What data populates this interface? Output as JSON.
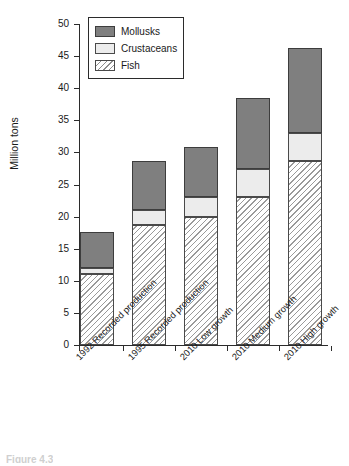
{
  "chart_data": {
    "type": "bar",
    "subtype": "stacked-bar",
    "title": "",
    "xlabel": "",
    "ylabel": "Million tons",
    "ylim": [
      0,
      50
    ],
    "yticks": [
      0,
      5,
      10,
      15,
      20,
      25,
      30,
      35,
      40,
      45,
      50
    ],
    "ytick_labels": [
      "0",
      "5",
      "10",
      "15",
      "20",
      "25",
      "30",
      "35",
      "40",
      "45",
      "50"
    ],
    "grid": false,
    "legend_position": "top-left-inside",
    "categories": [
      "1992 Recorded production",
      "1995 Recorded production",
      "2010 Low growth",
      "2010 Medium growth",
      "2010 High growth"
    ],
    "series": [
      {
        "name": "Fish",
        "values": [
          11.0,
          18.7,
          19.9,
          23.0,
          28.6
        ]
      },
      {
        "name": "Crustaceans",
        "values": [
          1.0,
          2.3,
          3.2,
          4.4,
          4.4
        ]
      },
      {
        "name": "Mollusks",
        "values": [
          5.6,
          7.7,
          7.7,
          11.1,
          13.2
        ]
      }
    ],
    "totals": [
      17.6,
      28.7,
      30.8,
      38.5,
      46.2
    ],
    "colors": {
      "mollusks": "#7f7f7f",
      "crustaceans": "#ececec",
      "fish": "#ffffff",
      "fish_hatch": "#9a9a9a",
      "axis": "#2b2b2b",
      "text": "#1a1a1a"
    }
  },
  "legend": {
    "entries": [
      {
        "label": "Mollusks",
        "swatch": "mollusks"
      },
      {
        "label": "Crustaceans",
        "swatch": "crustaceans"
      },
      {
        "label": "Fish",
        "swatch": "fish"
      }
    ]
  },
  "axis": {
    "y_title": "Million tons"
  },
  "caption": {
    "fragment": "Figure 4.3"
  }
}
